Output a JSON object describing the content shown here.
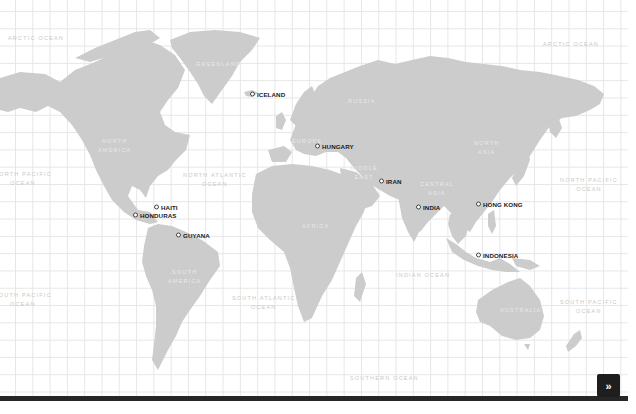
{
  "map": {
    "ocean_labels": [
      {
        "id": "arctic-ocean-west",
        "lines": [
          "ARCTIC OCEAN"
        ],
        "x": 8,
        "y": 34
      },
      {
        "id": "arctic-ocean-east",
        "lines": [
          "ARCTIC OCEAN"
        ],
        "x": 543,
        "y": 40
      },
      {
        "id": "north-pacific-ocean-west",
        "lines": [
          "NORTH PACIFIC",
          "OCEAN"
        ],
        "x": -6,
        "y": 170
      },
      {
        "id": "north-atlantic-ocean",
        "lines": [
          "NORTH ATLANTIC",
          "OCEAN"
        ],
        "x": 183,
        "y": 171
      },
      {
        "id": "north-pacific-ocean-east",
        "lines": [
          "NORTH PACIFIC",
          "OCEAN"
        ],
        "x": 560,
        "y": 176
      },
      {
        "id": "south-pacific-ocean-west",
        "lines": [
          "SOUTH PACIFIC",
          "OCEAN"
        ],
        "x": -6,
        "y": 291
      },
      {
        "id": "south-atlantic-ocean",
        "lines": [
          "SOUTH ATLANTIC",
          "OCEAN"
        ],
        "x": 232,
        "y": 294
      },
      {
        "id": "indian-ocean",
        "lines": [
          "INDIAN OCEAN"
        ],
        "x": 396,
        "y": 271
      },
      {
        "id": "south-pacific-ocean-east",
        "lines": [
          "SOUTH PACIFIC",
          "OCEAN"
        ],
        "x": 560,
        "y": 298
      },
      {
        "id": "southern-ocean",
        "lines": [
          "SOUTHERN OCEAN"
        ],
        "x": 350,
        "y": 374
      }
    ],
    "region_labels": [
      {
        "id": "greenland",
        "lines": [
          "GREENLAND"
        ],
        "x": 196,
        "y": 60
      },
      {
        "id": "north-america",
        "lines": [
          "NORTH",
          "AMERICA"
        ],
        "x": 98,
        "y": 137
      },
      {
        "id": "europe",
        "lines": [
          "EUROPE"
        ],
        "x": 292,
        "y": 137
      },
      {
        "id": "russia",
        "lines": [
          "RUSSIA"
        ],
        "x": 348,
        "y": 97
      },
      {
        "id": "north-asia",
        "lines": [
          "NORTH",
          "ASIA"
        ],
        "x": 474,
        "y": 139
      },
      {
        "id": "middle-east",
        "lines": [
          "MIDDLE",
          "EAST"
        ],
        "x": 350,
        "y": 164
      },
      {
        "id": "central-asia",
        "lines": [
          "CENTRAL",
          "ASIA"
        ],
        "x": 420,
        "y": 180
      },
      {
        "id": "africa",
        "lines": [
          "AFRICA"
        ],
        "x": 302,
        "y": 222
      },
      {
        "id": "south-america",
        "lines": [
          "SOUTH",
          "AMERICA"
        ],
        "x": 168,
        "y": 268
      },
      {
        "id": "australia",
        "lines": [
          "AUSTRALIA"
        ],
        "x": 500,
        "y": 306
      }
    ],
    "markers": [
      {
        "name": "ICELAND",
        "x": 250,
        "y": 94
      },
      {
        "name": "HUNGARY",
        "x": 315,
        "y": 146
      },
      {
        "name": "HAITI",
        "x": 154,
        "y": 207
      },
      {
        "name": "HONDURAS",
        "x": 133,
        "y": 215
      },
      {
        "name": "GUYANA",
        "x": 176,
        "y": 235
      },
      {
        "name": "IRAN",
        "x": 379,
        "y": 181
      },
      {
        "name": "INDIA",
        "x": 416,
        "y": 207
      },
      {
        "name": "HONG KONG",
        "x": 476,
        "y": 204
      },
      {
        "name": "INDONESIA",
        "x": 476,
        "y": 255
      }
    ],
    "colors": {
      "land": "#cccccc",
      "grid": "#e6e6e6",
      "marker_text": "#1a1a1a",
      "bar": "#262626"
    }
  },
  "controls": {
    "next_button": {
      "label": "»",
      "icon": "double-chevron-right-icon"
    }
  }
}
